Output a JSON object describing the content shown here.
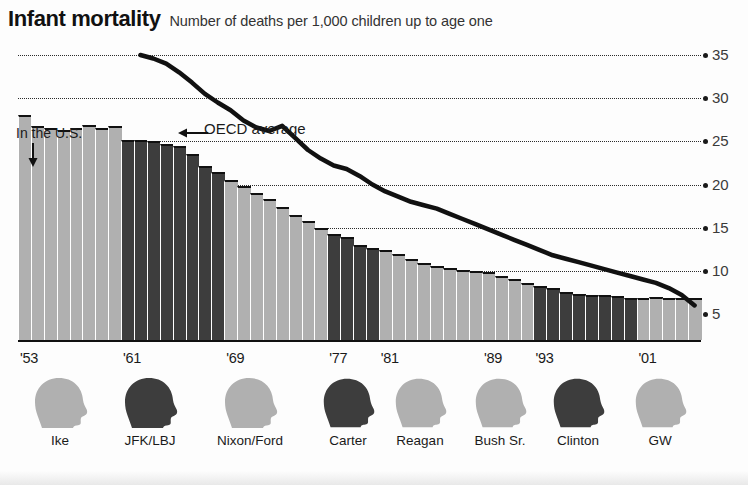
{
  "header": {
    "title": "Infant mortality",
    "subtitle": "Number of deaths per 1,000 children up to age one"
  },
  "annotations": {
    "us_label": "In the U.S.",
    "us_arrow_icon": "down-arrow-icon",
    "oecd_label": "OECD average",
    "oecd_arrow_icon": "left-arrow-icon"
  },
  "axis": {
    "y_ticks": [
      "35",
      "30",
      "25",
      "20",
      "15",
      "10",
      "5"
    ],
    "x_ticks": [
      "'53",
      "'61",
      "'69",
      "'77",
      "'81",
      "'89",
      "'93",
      "'01"
    ]
  },
  "presidents": [
    {
      "label": "Ike",
      "tone": "light"
    },
    {
      "label": "JFK/LBJ",
      "tone": "dark"
    },
    {
      "label": "Nixon/Ford",
      "tone": "light"
    },
    {
      "label": "Carter",
      "tone": "dark"
    },
    {
      "label": "Reagan",
      "tone": "light"
    },
    {
      "label": "Bush Sr.",
      "tone": "light"
    },
    {
      "label": "Clinton",
      "tone": "dark"
    },
    {
      "label": "GW",
      "tone": "light"
    }
  ],
  "colors": {
    "bar_light": "#b0b0b0",
    "bar_dark": "#3d3d3d",
    "line": "#111111",
    "grid": "#2b2b2b",
    "text": "#1a1a1a"
  },
  "chart_data": {
    "type": "bar",
    "title": "Infant mortality",
    "subtitle": "Number of deaths per 1,000 children up to age one",
    "xlabel": "",
    "ylabel": "Deaths per 1,000 live births",
    "ylim": [
      0,
      37
    ],
    "yticks": [
      5,
      10,
      15,
      20,
      25,
      30,
      35
    ],
    "grid": true,
    "legend": "annotations",
    "categories": [
      "1953",
      "1954",
      "1955",
      "1956",
      "1957",
      "1958",
      "1959",
      "1960",
      "1961",
      "1962",
      "1963",
      "1964",
      "1965",
      "1966",
      "1967",
      "1968",
      "1969",
      "1970",
      "1971",
      "1972",
      "1973",
      "1974",
      "1975",
      "1976",
      "1977",
      "1978",
      "1979",
      "1980",
      "1981",
      "1982",
      "1983",
      "1984",
      "1985",
      "1986",
      "1987",
      "1988",
      "1989",
      "1990",
      "1991",
      "1992",
      "1993",
      "1994",
      "1995",
      "1996",
      "1997",
      "1998",
      "1999",
      "2000",
      "2001",
      "2002",
      "2003",
      "2004",
      "2005"
    ],
    "series": [
      {
        "name": "In the U.S.",
        "type": "bar",
        "values": [
          28.0,
          26.8,
          26.6,
          26.3,
          26.5,
          26.9,
          26.6,
          26.8,
          25.2,
          25.2,
          25.0,
          24.7,
          24.5,
          23.5,
          22.2,
          21.5,
          20.5,
          19.8,
          19.0,
          18.3,
          17.4,
          16.5,
          15.8,
          15.0,
          14.3,
          13.9,
          13.0,
          12.6,
          12.4,
          11.9,
          11.4,
          10.9,
          10.6,
          10.3,
          10.1,
          10.0,
          9.9,
          9.4,
          9.0,
          8.6,
          8.3,
          8.0,
          7.6,
          7.3,
          7.2,
          7.2,
          7.1,
          6.9,
          6.8,
          7.0,
          6.8,
          6.8,
          6.8
        ],
        "palette": [
          "light",
          "light",
          "light",
          "light",
          "light",
          "light",
          "light",
          "light",
          "dark",
          "dark",
          "dark",
          "dark",
          "dark",
          "dark",
          "dark",
          "dark",
          "light",
          "light",
          "light",
          "light",
          "light",
          "light",
          "light",
          "light",
          "dark",
          "dark",
          "dark",
          "dark",
          "light",
          "light",
          "light",
          "light",
          "light",
          "light",
          "light",
          "light",
          "light",
          "light",
          "light",
          "light",
          "dark",
          "dark",
          "dark",
          "dark",
          "dark",
          "dark",
          "dark",
          "dark",
          "light",
          "light",
          "light",
          "light",
          "light"
        ]
      },
      {
        "name": "OECD average",
        "type": "line",
        "start_index": 9,
        "values": [
          null,
          null,
          null,
          null,
          null,
          null,
          null,
          null,
          null,
          35.0,
          34.6,
          34.0,
          33.0,
          31.8,
          30.5,
          29.5,
          28.6,
          27.4,
          26.6,
          26.2,
          26.8,
          25.4,
          24.0,
          23.0,
          22.2,
          21.8,
          21.0,
          20.0,
          19.2,
          18.6,
          18.0,
          17.6,
          17.2,
          16.6,
          16.0,
          15.4,
          14.8,
          14.2,
          13.6,
          13.0,
          12.4,
          11.8,
          11.4,
          11.0,
          10.6,
          10.2,
          9.8,
          9.4,
          9.0,
          8.6,
          8.0,
          7.2,
          6.0
        ]
      }
    ]
  }
}
